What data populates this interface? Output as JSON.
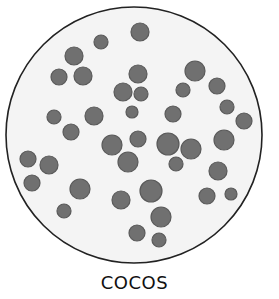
{
  "figure": {
    "label": "COCOS",
    "dish": {
      "cx": 134,
      "cy": 135,
      "r": 128,
      "fill": "#f4f4f4",
      "stroke": "#222222"
    },
    "colony_color": "#707070",
    "colony_rim_color": "#5a5a5a",
    "colonies": [
      {
        "x": 140,
        "y": 32,
        "r": 9
      },
      {
        "x": 101,
        "y": 42,
        "r": 7
      },
      {
        "x": 74,
        "y": 56,
        "r": 9
      },
      {
        "x": 59,
        "y": 77,
        "r": 8
      },
      {
        "x": 83,
        "y": 76,
        "r": 9
      },
      {
        "x": 138,
        "y": 74,
        "r": 9
      },
      {
        "x": 195,
        "y": 71,
        "r": 10
      },
      {
        "x": 123,
        "y": 92,
        "r": 9
      },
      {
        "x": 141,
        "y": 94,
        "r": 7
      },
      {
        "x": 183,
        "y": 90,
        "r": 7
      },
      {
        "x": 217,
        "y": 86,
        "r": 8
      },
      {
        "x": 54,
        "y": 117,
        "r": 7
      },
      {
        "x": 94,
        "y": 116,
        "r": 9
      },
      {
        "x": 132,
        "y": 112,
        "r": 6
      },
      {
        "x": 173,
        "y": 114,
        "r": 8
      },
      {
        "x": 227,
        "y": 107,
        "r": 7
      },
      {
        "x": 244,
        "y": 121,
        "r": 8
      },
      {
        "x": 71,
        "y": 132,
        "r": 8
      },
      {
        "x": 112,
        "y": 145,
        "r": 10
      },
      {
        "x": 138,
        "y": 139,
        "r": 8
      },
      {
        "x": 168,
        "y": 144,
        "r": 11
      },
      {
        "x": 191,
        "y": 149,
        "r": 10
      },
      {
        "x": 224,
        "y": 140,
        "r": 10
      },
      {
        "x": 28,
        "y": 159,
        "r": 8
      },
      {
        "x": 49,
        "y": 165,
        "r": 9
      },
      {
        "x": 128,
        "y": 162,
        "r": 10
      },
      {
        "x": 176,
        "y": 164,
        "r": 7
      },
      {
        "x": 218,
        "y": 171,
        "r": 9
      },
      {
        "x": 32,
        "y": 183,
        "r": 8
      },
      {
        "x": 80,
        "y": 189,
        "r": 10
      },
      {
        "x": 151,
        "y": 191,
        "r": 11
      },
      {
        "x": 121,
        "y": 200,
        "r": 9
      },
      {
        "x": 207,
        "y": 196,
        "r": 8
      },
      {
        "x": 231,
        "y": 194,
        "r": 6
      },
      {
        "x": 64,
        "y": 211,
        "r": 7
      },
      {
        "x": 161,
        "y": 217,
        "r": 10
      },
      {
        "x": 137,
        "y": 233,
        "r": 8
      },
      {
        "x": 159,
        "y": 240,
        "r": 7
      }
    ]
  }
}
